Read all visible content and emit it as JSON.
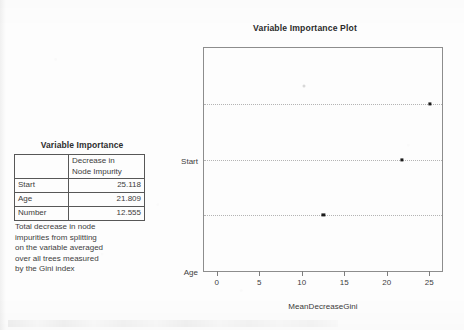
{
  "table": {
    "caption": "Variable Importance",
    "corner_header": "",
    "value_header": "Decrease in Node Impurity",
    "value_header_line1": "Decrease in",
    "value_header_line2": "Node Impurity",
    "rows": [
      {
        "name": "Start",
        "value": "25.118"
      },
      {
        "name": "Age",
        "value": "21.809"
      },
      {
        "name": "Number",
        "value": "12.555"
      }
    ],
    "footnote": "Total decrease in node impurities from splitting on the variable averaged over all trees measured by the Gini index",
    "footnote_lines": [
      "Total decrease in node",
      "impurities from splitting",
      "on the variable averaged",
      "over all trees measured",
      "by the Gini index"
    ]
  },
  "chart_data": {
    "type": "scatter",
    "title": "Variable Importance Plot",
    "xlabel": "MeanDecreaseGini",
    "ylabel": "",
    "categories": [
      "Number",
      "Age",
      "Start"
    ],
    "values": [
      12.555,
      21.809,
      25.118
    ],
    "points": [
      {
        "category": "Start",
        "value": 25.118
      },
      {
        "category": "Age",
        "value": 21.809
      },
      {
        "category": "Number",
        "value": 12.555
      }
    ],
    "xlim": [
      -1.5,
      26.5
    ],
    "xticks": [
      0,
      5,
      10,
      15,
      20,
      25
    ],
    "xtick_labels": [
      "0",
      "5",
      "10",
      "15",
      "20",
      "25"
    ],
    "grid": true,
    "grid_style": "dotted-horizontal",
    "legend": null,
    "marker": "filled-square",
    "marker_color": "#1b1b1b"
  }
}
